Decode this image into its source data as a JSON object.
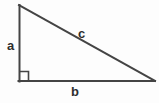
{
  "diagram": {
    "kind": "right-triangle",
    "canvas": {
      "width": 159,
      "height": 103,
      "background_color": "#fdfdfd"
    },
    "stroke": {
      "color": "#444444",
      "width": 2
    },
    "vertices": {
      "apex_top_left": {
        "x": 19,
        "y": 5
      },
      "right_angle_bottom_left": {
        "x": 19,
        "y": 81
      },
      "bottom_right": {
        "x": 155,
        "y": 81
      }
    },
    "right_angle_marker": {
      "present": true,
      "size": 9,
      "color": "#444444",
      "origin": {
        "x": 19,
        "y": 81
      }
    },
    "sides": [
      {
        "id": "side-a",
        "label": "a",
        "role": "vertical-leg",
        "label_color": "#2e2e2e"
      },
      {
        "id": "side-b",
        "label": "b",
        "role": "horizontal-leg",
        "label_color": "#2e2e2e"
      },
      {
        "id": "side-c",
        "label": "c",
        "role": "hypotenuse",
        "label_color": "#2e2e2e"
      }
    ]
  }
}
